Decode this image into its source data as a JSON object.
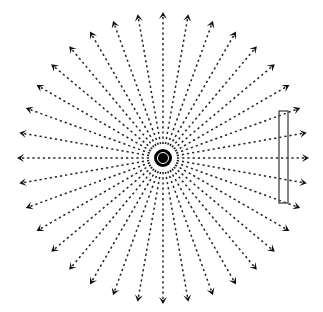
{
  "diagram": {
    "title": "",
    "source": {
      "cx": 163,
      "cy": 158,
      "outer_radius": 9,
      "ring_radius": 5.5,
      "inner_radius": 4,
      "color": "#000000"
    },
    "rays": {
      "count": 36,
      "angle_step_deg": 10,
      "start_radius": 14,
      "tip_radius": 146,
      "dash": "2.2 3",
      "stroke": "#222222",
      "stroke_width": 1.5
    },
    "detector": {
      "x": 279,
      "y": 111,
      "width": 9,
      "height": 92,
      "stroke": "#444444",
      "fill": "none"
    },
    "labels": []
  }
}
